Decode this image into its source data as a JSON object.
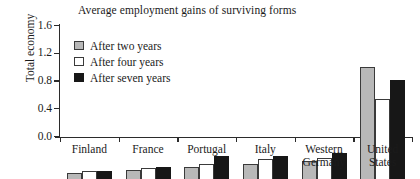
{
  "chart_data": {
    "type": "bar",
    "title": "Average employment gains of surviving forms",
    "xlabel": "",
    "ylabel": "Total economy",
    "ylim": [
      0.0,
      1.6
    ],
    "yticks": [
      "0.0",
      "0.4",
      "0.8",
      "1.2",
      "1.6"
    ],
    "ytick_values": [
      0.0,
      0.4,
      0.8,
      1.2,
      1.6
    ],
    "grid": false,
    "legend_position": "upper-left-inside",
    "categories": [
      "Finland",
      "France",
      "Portugal",
      "Italy",
      "Western\nGermany",
      "United\nStates"
    ],
    "series": [
      {
        "name": "After two years",
        "color": "#b8b8b8",
        "values": [
          0.08,
          0.13,
          0.17,
          0.22,
          0.26,
          1.61
        ]
      },
      {
        "name": "After four years",
        "color": "#ffffff",
        "values": [
          0.12,
          0.16,
          0.22,
          0.29,
          0.31,
          1.16
        ]
      },
      {
        "name": "After seven years",
        "color": "#171717",
        "values": [
          0.12,
          0.17,
          0.33,
          0.33,
          0.38,
          1.43
        ]
      }
    ]
  }
}
